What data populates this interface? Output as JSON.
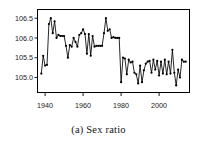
{
  "figure": {
    "caption": "(a) Sex ratio",
    "caption_label": "(a)",
    "caption_text": "Sex ratio"
  },
  "chart_data": {
    "type": "line",
    "title": "",
    "xlabel": "",
    "ylabel": "",
    "xlim": [
      1936,
      2016
    ],
    "ylim": [
      104.62,
      106.72
    ],
    "grid": false,
    "legend": "none",
    "marker": "filled-circle",
    "line_color": "#000000",
    "marker_color": "#000000",
    "xticks": [
      1940,
      1960,
      1980,
      2000
    ],
    "xtick_labels": [
      "1940",
      "1960",
      "1980",
      "2000"
    ],
    "yticks": [
      105.0,
      105.5,
      106.0,
      106.5
    ],
    "ytick_labels": [
      "105.0",
      "105.5",
      "106.0",
      "106.5"
    ],
    "x": [
      1938,
      1939,
      1940,
      1941,
      1942,
      1943,
      1944,
      1945,
      1946,
      1947,
      1948,
      1949,
      1950,
      1951,
      1952,
      1953,
      1954,
      1955,
      1956,
      1957,
      1958,
      1959,
      1960,
      1961,
      1962,
      1963,
      1964,
      1965,
      1966,
      1967,
      1968,
      1969,
      1970,
      1971,
      1972,
      1973,
      1974,
      1975,
      1976,
      1977,
      1978,
      1979,
      1980,
      1981,
      1982,
      1983,
      1984,
      1985,
      1986,
      1987,
      1988,
      1989,
      1990,
      1991,
      1992,
      1993,
      1994,
      1995,
      1996,
      1997,
      1998,
      1999,
      2000,
      2001,
      2002,
      2003,
      2004,
      2005,
      2006,
      2007,
      2008,
      2009,
      2010,
      2011,
      2012,
      2013,
      2014
    ],
    "y": [
      105.1,
      105.55,
      105.3,
      105.32,
      106.35,
      106.5,
      106.12,
      106.42,
      106.0,
      106.08,
      106.05,
      106.05,
      106.05,
      105.8,
      105.5,
      105.82,
      105.78,
      106.0,
      105.9,
      105.78,
      106.08,
      106.12,
      106.22,
      106.1,
      105.6,
      106.1,
      105.55,
      106.05,
      105.78,
      105.8,
      105.8,
      105.8,
      105.8,
      106.12,
      106.5,
      106.18,
      106.22,
      106.0,
      106.02,
      106.0,
      106.0,
      106.0,
      104.88,
      105.5,
      105.48,
      105.08,
      105.45,
      105.38,
      105.4,
      105.12,
      105.08,
      104.85,
      105.3,
      104.88,
      105.18,
      105.35,
      105.4,
      105.42,
      105.12,
      105.45,
      105.2,
      105.42,
      105.05,
      105.4,
      105.1,
      105.45,
      105.08,
      105.4,
      105.1,
      105.7,
      105.12,
      104.8,
      105.2,
      105.0,
      105.45,
      105.4,
      105.4
    ]
  }
}
